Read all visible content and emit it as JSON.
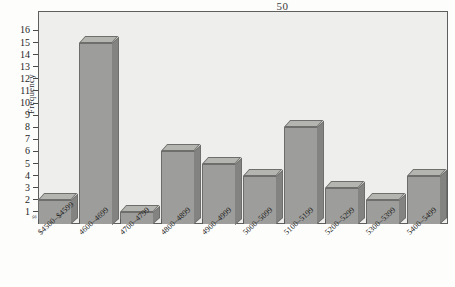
{
  "page": {
    "number": "50"
  },
  "chart_data": {
    "type": "bar",
    "title": "",
    "subtitle": "",
    "xlabel": "",
    "ylabel": "Frequency",
    "categories": [
      "$4500–$4599",
      "4600–4699",
      "4700–4799",
      "4800–4899",
      "4900–4999",
      "5000–5099",
      "5100–5199",
      "5200–5299",
      "5300–5399",
      "5400–5499"
    ],
    "values": [
      2,
      15,
      1,
      6,
      5,
      4,
      8,
      3,
      2,
      4
    ],
    "ylim": [
      0,
      16
    ],
    "ytick_labels": [
      "16",
      "15",
      "14",
      "13",
      "12",
      "11",
      "10",
      "9",
      "8",
      "7",
      "6",
      "5",
      "4",
      "3",
      "2",
      "1"
    ],
    "ytick_values": [
      16,
      15,
      14,
      13,
      12,
      11,
      10,
      9,
      8,
      7,
      6,
      5,
      4,
      3,
      2,
      1
    ],
    "grid": false,
    "legend": null,
    "axis_break": "≈",
    "style": "3d-bars",
    "colors": {
      "bar_front": "#9d9d9b",
      "bar_top": "#b4b4b1",
      "bar_side": "#838381",
      "bar_outline": "#6e6e6c",
      "plot_background": "#eeeeec",
      "axis": "#5e5e5e",
      "text": "#1d1d1d"
    }
  }
}
